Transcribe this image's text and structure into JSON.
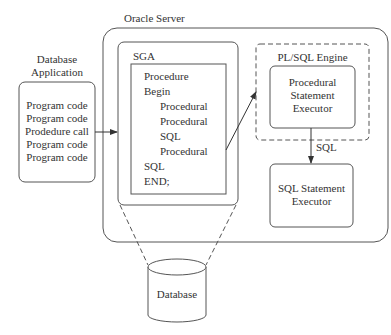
{
  "title_oracle_server": "Oracle Server",
  "database_application": {
    "label_line1": "Database",
    "label_line2": "Application",
    "lines": [
      "Program code",
      "Program code",
      "Prodedure call",
      "Program code",
      "Program code"
    ]
  },
  "sga": {
    "label": "SGA",
    "code": [
      {
        "text": "Procedure",
        "indent": 0
      },
      {
        "text": "Begin",
        "indent": 0
      },
      {
        "text": "Procedural",
        "indent": 1
      },
      {
        "text": "Procedural",
        "indent": 1
      },
      {
        "text": "SQL",
        "indent": 1
      },
      {
        "text": "Procedural",
        "indent": 1
      },
      {
        "text": "SQL",
        "indent": 0
      },
      {
        "text": "END;",
        "indent": 0
      }
    ]
  },
  "plsql_engine": {
    "label": "PL/SQL Engine",
    "executor_lines": [
      "Procedural",
      "Statement",
      "Executor"
    ]
  },
  "sql_arrow_label": "SQL",
  "sql_executor": {
    "lines": [
      "SQL Statement",
      "Executor"
    ]
  },
  "database": {
    "label": "Database"
  },
  "colors": {
    "stroke": "#555555",
    "text": "#333333"
  }
}
